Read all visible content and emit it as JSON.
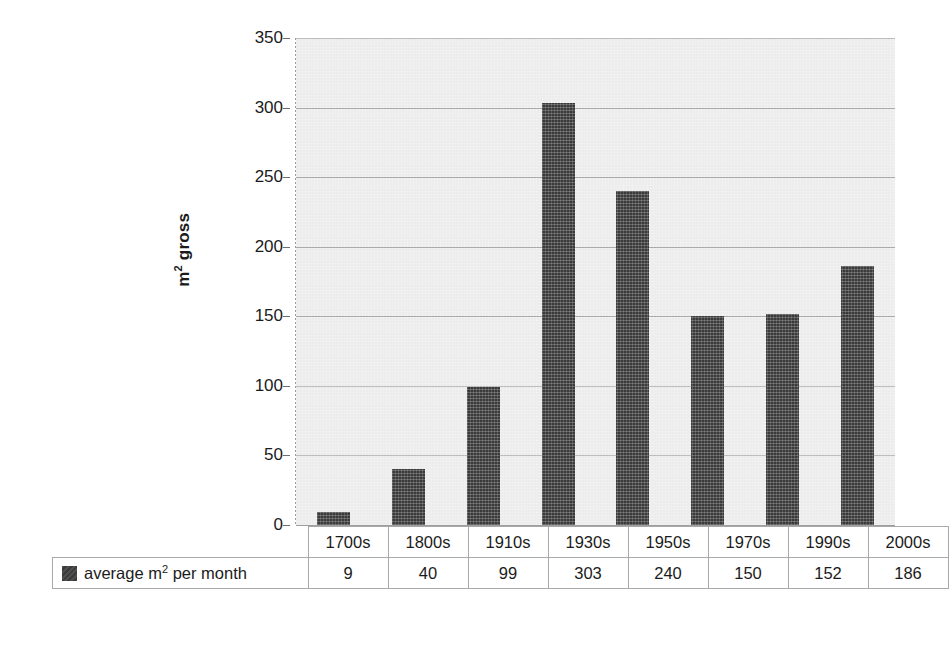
{
  "chart_data": {
    "type": "bar",
    "title": "",
    "xlabel": "",
    "ylabel": "m² gross",
    "ylim": [
      0,
      350
    ],
    "ytick_step": 50,
    "yticks": [
      0,
      50,
      100,
      150,
      200,
      250,
      300,
      350
    ],
    "grid": true,
    "legend_position": "data-table-below",
    "categories": [
      "1700s",
      "1800s",
      "1910s",
      "1930s",
      "1950s",
      "1970s",
      "1990s",
      "2000s"
    ],
    "series": [
      {
        "name": "average m² per month",
        "values": [
          9,
          40,
          99,
          303,
          240,
          150,
          152,
          186
        ]
      }
    ]
  },
  "axis": {
    "y_title_main": "m",
    "y_title_sup": "2",
    "y_title_rest": " gross",
    "tick_labels": [
      "350",
      "300",
      "250",
      "200",
      "150",
      "100",
      "50",
      "0"
    ]
  },
  "table": {
    "legend_label_main": "average m",
    "legend_label_sup": "2",
    "legend_label_rest": " per month",
    "header": [
      "1700s",
      "1800s",
      "1910s",
      "1930s",
      "1950s",
      "1970s",
      "1990s",
      "2000s"
    ],
    "values": [
      "9",
      "40",
      "99",
      "303",
      "240",
      "150",
      "152",
      "186"
    ]
  },
  "colors": {
    "bar": "#3a3a3a",
    "plot_background": "#ececec",
    "gridline": "#9a9a9a",
    "page_background": "#ffffff",
    "text": "#1b1b1b"
  }
}
